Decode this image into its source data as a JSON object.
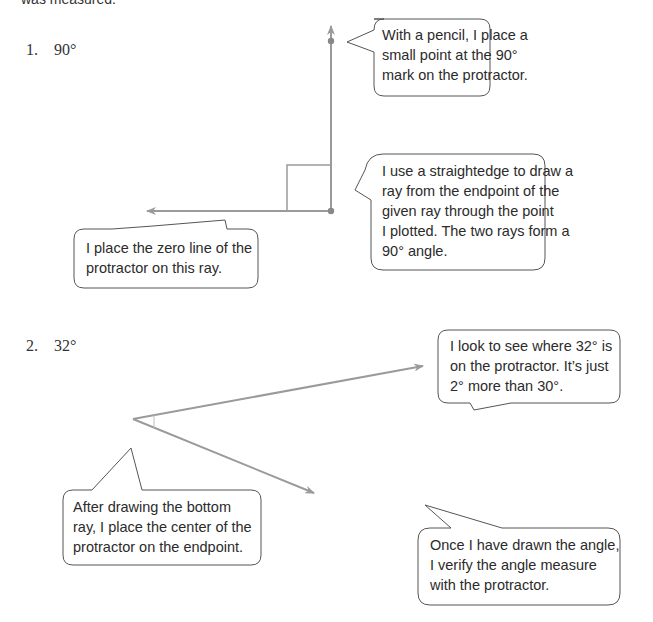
{
  "intro_text": "was measured.",
  "problems": [
    {
      "number": "1.",
      "angle": "90°",
      "callouts": [
        {
          "lines": [
            "With a pencil, I place a",
            "small point at the 90°",
            "mark on the protractor."
          ]
        },
        {
          "lines": [
            "I use a straightedge to draw a",
            "ray from the endpoint of the",
            "given ray through the point",
            "I plotted.  The two rays form a",
            "90° angle."
          ]
        },
        {
          "lines": [
            "I place the zero line of the",
            "protractor on this ray."
          ]
        }
      ]
    },
    {
      "number": "2.",
      "angle": "32°",
      "callouts": [
        {
          "lines": [
            "I look to see where 32° is",
            "on the protractor.  It’s just",
            "2° more than 30°."
          ]
        },
        {
          "lines": [
            "After drawing the bottom",
            "ray, I place the center of the",
            "protractor on the endpoint."
          ]
        },
        {
          "lines": [
            "Once I have drawn the angle,",
            "I verify the angle measure",
            "with the protractor."
          ]
        }
      ]
    }
  ],
  "colors": {
    "ray": "#9a9a9a",
    "bubble_border": "#555555",
    "text": "#2b2b2b"
  }
}
